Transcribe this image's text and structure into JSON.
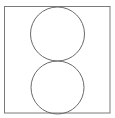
{
  "diagram": {
    "frame": {
      "x": 4.5,
      "y": 6.5,
      "width": 105.5,
      "height": 106.5,
      "stroke": "#7a7a7a"
    },
    "circles": [
      {
        "name": "top-circle",
        "cx": 57.5,
        "cy": 34,
        "r": 27,
        "stroke": "#6a6a6a"
      },
      {
        "name": "bottom-circle",
        "cx": 57.5,
        "cy": 87.5,
        "r": 26.5,
        "stroke": "#6a6a6a"
      }
    ]
  }
}
